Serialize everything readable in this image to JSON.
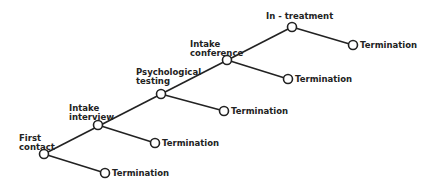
{
  "diagram": {
    "nodes": [
      {
        "id": "first-contact",
        "label_line1": "First",
        "label_line2": "contact"
      },
      {
        "id": "intake-interview",
        "label_line1": "Intake",
        "label_line2": "interview"
      },
      {
        "id": "psychological-testing",
        "label_line1": "Psychological",
        "label_line2": "testing"
      },
      {
        "id": "intake-conference",
        "label_line1": "Intake",
        "label_line2": "conference"
      },
      {
        "id": "in-treatment",
        "label_line1": "In - treatment"
      }
    ],
    "terminations": [
      {
        "label": "Termination"
      },
      {
        "label": "Termination"
      },
      {
        "label": "Termination"
      },
      {
        "label": "Termination"
      },
      {
        "label": "Termination"
      }
    ],
    "stroke_color": "#222222"
  }
}
